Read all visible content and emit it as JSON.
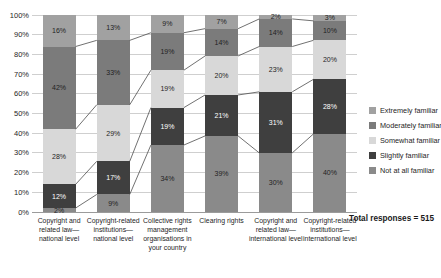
{
  "chart_data": {
    "type": "bar",
    "subtype": "stacked-100-percent-column",
    "title": "",
    "categories": [
      "Copyright and related law—national level",
      "Copyright-related institutions—national level",
      "Collective rights management organisations in your country",
      "Clearing rights",
      "Copyright and related law—international level",
      "Copyright-related institutions—international level"
    ],
    "series": [
      {
        "name": "Not at all familiar",
        "color": "#8a8a8a",
        "label_color": "#1f1f1f",
        "values": [
          2,
          9,
          34,
          39,
          30,
          40
        ]
      },
      {
        "name": "Slightly familiar",
        "color": "#3f3f3f",
        "label_color": "#ffffff",
        "values": [
          12,
          17,
          19,
          21,
          31,
          28
        ]
      },
      {
        "name": "Somewhat familiar",
        "color": "#d8d8d8",
        "label_color": "#1f1f1f",
        "values": [
          28,
          29,
          19,
          20,
          23,
          20
        ]
      },
      {
        "name": "Moderately familiar",
        "color": "#7b7b7b",
        "label_color": "#1f1f1f",
        "values": [
          42,
          33,
          19,
          14,
          14,
          10
        ]
      },
      {
        "name": "Extremely familiar",
        "color": "#a1a1a1",
        "label_color": "#1f1f1f",
        "values": [
          16,
          13,
          9,
          7,
          2,
          3
        ]
      }
    ],
    "data_label_suffix": "%",
    "legend_order": [
      "Extremely familiar",
      "Moderately familiar",
      "Somewhat familiar",
      "Slightly familiar",
      "Not at all familiar"
    ],
    "legend_position": "right",
    "y_ticks": [
      "0%",
      "10%",
      "20%",
      "30%",
      "40%",
      "50%",
      "60%",
      "70%",
      "80%",
      "90%",
      "100%"
    ],
    "ylim": [
      0,
      100
    ],
    "grid": "horizontal",
    "series_connector_lines": true,
    "note": "Total responses = 515",
    "colors": {
      "gridline": "#cfcfcf",
      "axis_line": "#9b9b9b",
      "connector_line": "#4d4d4d",
      "background": "#ffffff"
    }
  }
}
